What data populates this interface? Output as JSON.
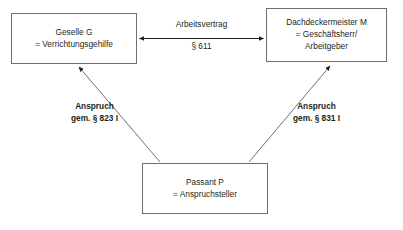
{
  "diagram": {
    "type": "legal-relationship-diagram",
    "line_color": "#6f6f72",
    "text_color": "#231f20",
    "background": "#ffffff",
    "nodes": [
      {
        "id": "geselle",
        "lines": [
          "Geselle G",
          "= Verrichtungsgehilfe"
        ],
        "line1": "Geselle G",
        "line2": "= Verrichtungsgehilfe"
      },
      {
        "id": "meister",
        "lines": [
          "Dachdeckermeister M",
          "= Geschäftsherr/",
          "Arbeitgeber"
        ],
        "line1": "Dachdeckermeister M",
        "line2": "= Geschäftsherr/",
        "line3": "Arbeitgeber"
      },
      {
        "id": "passant",
        "lines": [
          "Passant P",
          "= Anspruchsteller"
        ],
        "line1": "Passant P",
        "line2": "= Anspruchsteller"
      }
    ],
    "edges": [
      {
        "id": "arbeitsvertrag",
        "from": "geselle",
        "to": "meister",
        "arrowheads": "both",
        "label_line1": "Arbeitsvertrag",
        "label_line2": "§ 611"
      },
      {
        "id": "anspruch-823",
        "from": "passant",
        "to": "geselle",
        "arrowheads": "end",
        "label_line1": "Anspruch",
        "label_line2": "gem. § 823 I"
      },
      {
        "id": "anspruch-831",
        "from": "passant",
        "to": "meister",
        "arrowheads": "end",
        "label_line1": "Anspruch",
        "label_line2": "gem. § 831 I"
      }
    ]
  }
}
